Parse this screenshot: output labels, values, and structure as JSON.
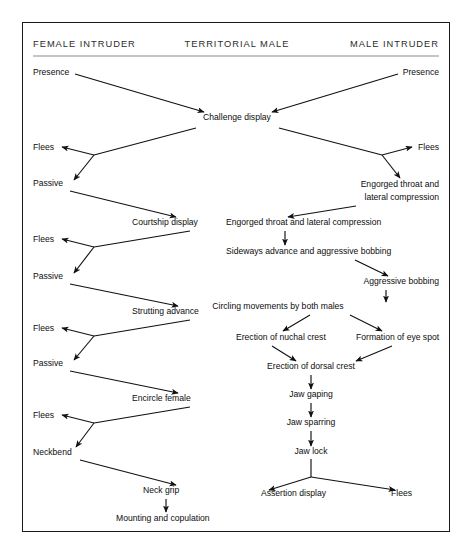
{
  "diagram": {
    "columns": [
      {
        "id": "female-intruder",
        "label": "FEMALE INTRUDER"
      },
      {
        "id": "territorial-male",
        "label": "TERRITORIAL MALE"
      },
      {
        "id": "male-intruder",
        "label": "MALE INTRUDER"
      }
    ],
    "nodes": [
      {
        "id": "presence-female",
        "label": "Presence",
        "column": "female-intruder",
        "x": 33,
        "y": 75,
        "anchor": "start"
      },
      {
        "id": "presence-male",
        "label": "Presence",
        "column": "male-intruder",
        "x": 439,
        "y": 75,
        "anchor": "end"
      },
      {
        "id": "challenge-display",
        "label": "Challenge display",
        "column": "territorial-male",
        "x": 237,
        "y": 120,
        "anchor": "middle"
      },
      {
        "id": "flees-f1",
        "label": "Flees",
        "column": "female-intruder",
        "x": 33,
        "y": 150,
        "anchor": "start"
      },
      {
        "id": "flees-m1",
        "label": "Flees",
        "column": "male-intruder",
        "x": 439,
        "y": 150,
        "anchor": "end"
      },
      {
        "id": "passive-f1",
        "label": "Passive",
        "column": "female-intruder",
        "x": 33,
        "y": 186,
        "anchor": "start"
      },
      {
        "id": "engorged-throat-male-l1",
        "label": "Engorged throat and",
        "column": "male-intruder",
        "x": 439,
        "y": 187,
        "anchor": "end"
      },
      {
        "id": "engorged-throat-male-l2",
        "label": "lateral compression",
        "column": "male-intruder",
        "x": 439,
        "y": 200,
        "anchor": "end"
      },
      {
        "id": "courtship-display",
        "label": "Courtship display",
        "column": "territorial-male",
        "x": 132,
        "y": 225,
        "anchor": "start"
      },
      {
        "id": "engorged-throat-territorial",
        "label": "Engorged throat and lateral compression",
        "column": "territorial-male",
        "x": 226,
        "y": 225,
        "anchor": "start"
      },
      {
        "id": "sideways-advance",
        "label": "Sideways advance and aggressive bobbing",
        "column": "territorial-male",
        "x": 226,
        "y": 254,
        "anchor": "start"
      },
      {
        "id": "flees-f2",
        "label": "Flees",
        "column": "female-intruder",
        "x": 33,
        "y": 242,
        "anchor": "start"
      },
      {
        "id": "passive-f2",
        "label": "Passive",
        "column": "female-intruder",
        "x": 33,
        "y": 279,
        "anchor": "start"
      },
      {
        "id": "aggressive-bobbing",
        "label": "Aggressive bobbing",
        "column": "male-intruder",
        "x": 439,
        "y": 284,
        "anchor": "end"
      },
      {
        "id": "strutting-advance",
        "label": "Strutting advance",
        "column": "territorial-male",
        "x": 132,
        "y": 314,
        "anchor": "start"
      },
      {
        "id": "circling-movements",
        "label": "Circling movements by both males",
        "column": "territorial-male",
        "x": 278,
        "y": 309,
        "anchor": "middle"
      },
      {
        "id": "flees-f3",
        "label": "Flees",
        "column": "female-intruder",
        "x": 33,
        "y": 331,
        "anchor": "start"
      },
      {
        "id": "passive-f3",
        "label": "Passive",
        "column": "female-intruder",
        "x": 33,
        "y": 366,
        "anchor": "start"
      },
      {
        "id": "erection-nuchal-crest",
        "label": "Erection of nuchal crest",
        "column": "territorial-male",
        "x": 236,
        "y": 340,
        "anchor": "start"
      },
      {
        "id": "formation-eye-spot",
        "label": "Formation of eye spot",
        "column": "male-intruder",
        "x": 356,
        "y": 340,
        "anchor": "start"
      },
      {
        "id": "erection-dorsal-crest",
        "label": "Erection of dorsal crest",
        "column": "territorial-male",
        "x": 311,
        "y": 369,
        "anchor": "middle"
      },
      {
        "id": "encircle-female",
        "label": "Encircle female",
        "column": "territorial-male",
        "x": 132,
        "y": 401,
        "anchor": "start"
      },
      {
        "id": "jaw-gaping",
        "label": "Jaw gaping",
        "column": "territorial-male",
        "x": 311,
        "y": 397,
        "anchor": "middle"
      },
      {
        "id": "jaw-sparring",
        "label": "Jaw sparring",
        "column": "territorial-male",
        "x": 311,
        "y": 425,
        "anchor": "middle"
      },
      {
        "id": "jaw-lock",
        "label": "Jaw lock",
        "column": "territorial-male",
        "x": 311,
        "y": 454,
        "anchor": "middle"
      },
      {
        "id": "flees-f4",
        "label": "Flees",
        "column": "female-intruder",
        "x": 33,
        "y": 418,
        "anchor": "start"
      },
      {
        "id": "neckbend",
        "label": "Neckbend",
        "column": "female-intruder",
        "x": 33,
        "y": 455,
        "anchor": "start"
      },
      {
        "id": "neck-grip",
        "label": "Neck grip",
        "column": "territorial-male",
        "x": 143,
        "y": 493,
        "anchor": "start"
      },
      {
        "id": "mounting-copulation",
        "label": "Mounting and copulation",
        "column": "territorial-male",
        "x": 116,
        "y": 521,
        "anchor": "start"
      },
      {
        "id": "assertion-display",
        "label": "Assertion display",
        "column": "territorial-male",
        "x": 261,
        "y": 496,
        "anchor": "start"
      },
      {
        "id": "flees-m2",
        "label": "Flees",
        "column": "male-intruder",
        "x": 391,
        "y": 496,
        "anchor": "start"
      }
    ],
    "edges": [
      {
        "id": "presence-female-to-challenge",
        "from": "presence-female",
        "to": "challenge-display",
        "arrow": true
      },
      {
        "id": "presence-male-to-challenge",
        "from": "presence-male",
        "to": "challenge-display",
        "arrow": true
      },
      {
        "id": "challenge-to-female-branch",
        "from": "challenge-display",
        "to": "female-branch-1",
        "arrow": false
      },
      {
        "id": "female-branch-1-to-flees",
        "from": "female-branch-1",
        "to": "flees-f1",
        "arrow": true
      },
      {
        "id": "female-branch-1-to-passive",
        "from": "female-branch-1",
        "to": "passive-f1",
        "arrow": true
      },
      {
        "id": "challenge-to-male-branch",
        "from": "challenge-display",
        "to": "male-branch-1",
        "arrow": false
      },
      {
        "id": "male-branch-1-to-flees",
        "from": "male-branch-1",
        "to": "flees-m1",
        "arrow": true
      },
      {
        "id": "male-branch-1-to-engorged",
        "from": "male-branch-1",
        "to": "engorged-throat-male-l1",
        "arrow": true
      },
      {
        "id": "passive-f1-to-courtship",
        "from": "passive-f1",
        "to": "courtship-display",
        "arrow": true
      },
      {
        "id": "courtship-to-female-branch-2",
        "from": "courtship-display",
        "to": "female-branch-2",
        "arrow": false
      },
      {
        "id": "female-branch-2-to-flees",
        "from": "female-branch-2",
        "to": "flees-f2",
        "arrow": true
      },
      {
        "id": "female-branch-2-to-passive",
        "from": "female-branch-2",
        "to": "passive-f2",
        "arrow": true
      },
      {
        "id": "engorged-male-to-engorged-territorial",
        "from": "engorged-throat-male-l2",
        "to": "engorged-throat-territorial",
        "arrow": true
      },
      {
        "id": "engorged-territorial-to-sideways",
        "from": "engorged-throat-territorial",
        "to": "sideways-advance",
        "arrow": true
      },
      {
        "id": "sideways-to-aggressive-bobbing",
        "from": "sideways-advance",
        "to": "aggressive-bobbing",
        "arrow": true
      },
      {
        "id": "aggressive-bobbing-to-circling",
        "from": "aggressive-bobbing",
        "to": "circling-movements",
        "arrow": true
      },
      {
        "id": "passive-f2-to-strutting",
        "from": "passive-f2",
        "to": "strutting-advance",
        "arrow": true
      },
      {
        "id": "strutting-to-female-branch-3",
        "from": "strutting-advance",
        "to": "female-branch-3",
        "arrow": false
      },
      {
        "id": "female-branch-3-to-flees",
        "from": "female-branch-3",
        "to": "flees-f3",
        "arrow": true
      },
      {
        "id": "female-branch-3-to-passive",
        "from": "female-branch-3",
        "to": "passive-f3",
        "arrow": true
      },
      {
        "id": "circling-to-nuchal-crest",
        "from": "circling-movements",
        "to": "erection-nuchal-crest",
        "arrow": true
      },
      {
        "id": "circling-to-eye-spot",
        "from": "circling-movements",
        "to": "formation-eye-spot",
        "arrow": true
      },
      {
        "id": "nuchal-crest-to-dorsal-crest",
        "from": "erection-nuchal-crest",
        "to": "erection-dorsal-crest",
        "arrow": true
      },
      {
        "id": "eye-spot-to-dorsal-crest",
        "from": "formation-eye-spot",
        "to": "erection-dorsal-crest",
        "arrow": true
      },
      {
        "id": "dorsal-crest-to-jaw-gaping",
        "from": "erection-dorsal-crest",
        "to": "jaw-gaping",
        "arrow": true
      },
      {
        "id": "jaw-gaping-to-jaw-sparring",
        "from": "jaw-gaping",
        "to": "jaw-sparring",
        "arrow": true
      },
      {
        "id": "jaw-sparring-to-jaw-lock",
        "from": "jaw-sparring",
        "to": "jaw-lock",
        "arrow": true
      },
      {
        "id": "jaw-lock-to-assertion",
        "from": "jaw-lock",
        "to": "assertion-display",
        "arrow": true
      },
      {
        "id": "jaw-lock-to-flees",
        "from": "jaw-lock",
        "to": "flees-m2",
        "arrow": true
      },
      {
        "id": "passive-f3-to-encircle",
        "from": "passive-f3",
        "to": "encircle-female",
        "arrow": true
      },
      {
        "id": "encircle-to-female-branch-4",
        "from": "encircle-female",
        "to": "female-branch-4",
        "arrow": false
      },
      {
        "id": "female-branch-4-to-flees",
        "from": "female-branch-4",
        "to": "flees-f4",
        "arrow": true
      },
      {
        "id": "female-branch-4-to-neckbend",
        "from": "female-branch-4",
        "to": "neckbend",
        "arrow": true
      },
      {
        "id": "neckbend-to-neck-grip",
        "from": "neckbend",
        "to": "neck-grip",
        "arrow": true
      },
      {
        "id": "neck-grip-to-mounting",
        "from": "neck-grip",
        "to": "mounting-copulation",
        "arrow": true
      }
    ],
    "colors": {
      "frame": "#1a1a1a",
      "rule": "#8a8a8a",
      "text": "#0d0d0d",
      "header_text": "#2b2b2b",
      "background": "#ffffff"
    }
  }
}
